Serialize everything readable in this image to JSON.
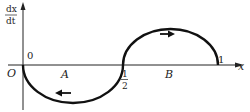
{
  "figure": {
    "type": "velocity-position diagram",
    "y_axis_label": {
      "numerator": "dx",
      "denominator": "dt"
    },
    "x_axis_label": "x",
    "origin_label": "O",
    "tick_labels": {
      "zero": "0",
      "half": {
        "numerator": "1",
        "denominator": "2"
      },
      "one": "1"
    },
    "region_labels": [
      "A",
      "B"
    ],
    "curves": [
      {
        "name": "lower-semicircle",
        "from_x": 0,
        "to_x": 0.5,
        "sign": "negative",
        "direction": "left",
        "region": "A"
      },
      {
        "name": "upper-semicircle",
        "from_x": 0.5,
        "to_x": 1,
        "sign": "positive",
        "direction": "right",
        "region": "B"
      }
    ],
    "colors": {
      "ink": "#222222",
      "background": "#ffffff"
    }
  }
}
